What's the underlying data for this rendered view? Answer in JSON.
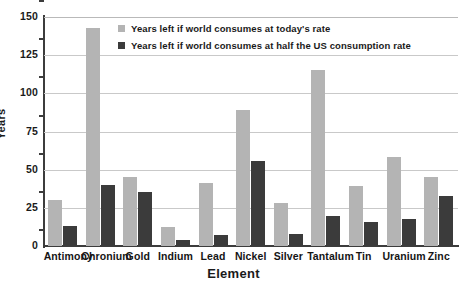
{
  "chart_data": {
    "type": "bar",
    "title": "",
    "xlabel": "Element",
    "ylabel": "Years",
    "ylim": [
      0,
      150
    ],
    "yticks": [
      0,
      25,
      50,
      75,
      100,
      125,
      150
    ],
    "ytick_labels": [
      "0",
      "25",
      "50",
      "75",
      "100",
      "125",
      "150"
    ],
    "grid": true,
    "legend_position": "top-center",
    "categories": [
      "Antimony",
      "Chronium",
      "Gold",
      "Indium",
      "Lead",
      "Nickel",
      "Silver",
      "Tantalum",
      "Tin",
      "Uranium",
      "Zinc"
    ],
    "series": [
      {
        "name": "Years left if world consumes at today's rate",
        "color": "#b4b4b4",
        "values": [
          30,
          143,
          45,
          12.5,
          41,
          89,
          28,
          115,
          39,
          58,
          45
        ]
      },
      {
        "name": "Years left if world consumes at half the US consumption rate",
        "color": "#3b3b3b",
        "values": [
          13,
          40,
          35.5,
          4,
          7.5,
          56,
          8,
          19.5,
          16,
          18,
          33
        ]
      }
    ]
  },
  "colors": {
    "series_light": "#b4b4b4",
    "series_dark": "#3b3b3b",
    "axis": "#3c3c3c",
    "gridline": "#c9c9c9",
    "text": "#1a1a1a",
    "background": "#ffffff"
  }
}
